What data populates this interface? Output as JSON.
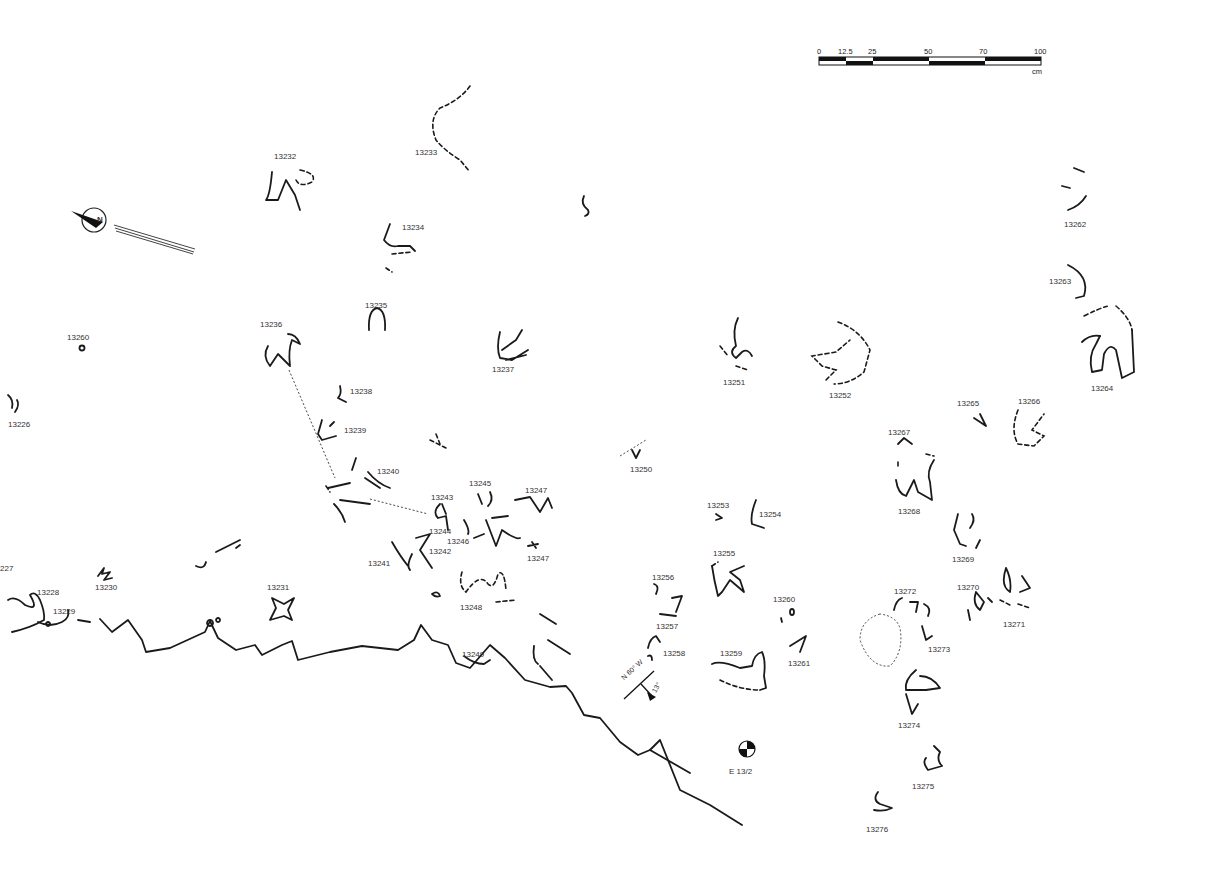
{
  "scale_bar": {
    "ticks": [
      "0",
      "12.5",
      "25",
      "50",
      "70",
      "100"
    ],
    "unit": "cm"
  },
  "north_arrow": {
    "label": "N"
  },
  "strike_dip": {
    "strike": "N 60° W",
    "dip": "13°"
  },
  "station": {
    "label": "E  13/2"
  },
  "tracks": [
    {
      "id": "13226",
      "x": 8,
      "y": 421
    },
    {
      "id": "13227",
      "x": 0,
      "y": 565,
      "partial_label": "227"
    },
    {
      "id": "13228",
      "x": 37,
      "y": 589
    },
    {
      "id": "13229",
      "x": 53,
      "y": 608
    },
    {
      "id": "13230",
      "x": 95,
      "y": 584
    },
    {
      "id": "13231",
      "x": 267,
      "y": 584
    },
    {
      "id": "13232",
      "x": 274,
      "y": 153
    },
    {
      "id": "13233",
      "x": 415,
      "y": 149
    },
    {
      "id": "13234",
      "x": 402,
      "y": 224
    },
    {
      "id": "13235",
      "x": 365,
      "y": 302
    },
    {
      "id": "13236",
      "x": 260,
      "y": 321
    },
    {
      "id": "13237",
      "x": 492,
      "y": 366
    },
    {
      "id": "13238",
      "x": 350,
      "y": 388
    },
    {
      "id": "13239",
      "x": 344,
      "y": 427
    },
    {
      "id": "13240",
      "x": 377,
      "y": 468
    },
    {
      "id": "13241",
      "x": 368,
      "y": 560
    },
    {
      "id": "13242",
      "x": 429,
      "y": 548
    },
    {
      "id": "13243",
      "x": 431,
      "y": 494
    },
    {
      "id": "13244",
      "x": 429,
      "y": 528
    },
    {
      "id": "13245",
      "x": 469,
      "y": 480
    },
    {
      "id": "13246",
      "x": 447,
      "y": 538
    },
    {
      "id": "13247",
      "x": 525,
      "y": 487
    },
    {
      "id": "13247",
      "x": 527,
      "y": 555
    },
    {
      "id": "13248",
      "x": 460,
      "y": 604
    },
    {
      "id": "13249",
      "x": 462,
      "y": 651
    },
    {
      "id": "13250",
      "x": 630,
      "y": 466
    },
    {
      "id": "13251",
      "x": 723,
      "y": 379
    },
    {
      "id": "13252",
      "x": 829,
      "y": 392
    },
    {
      "id": "13253",
      "x": 707,
      "y": 502
    },
    {
      "id": "13254",
      "x": 759,
      "y": 511
    },
    {
      "id": "13255",
      "x": 713,
      "y": 550
    },
    {
      "id": "13256",
      "x": 652,
      "y": 574
    },
    {
      "id": "13257",
      "x": 656,
      "y": 623
    },
    {
      "id": "13258",
      "x": 663,
      "y": 650
    },
    {
      "id": "13259",
      "x": 720,
      "y": 650
    },
    {
      "id": "13260",
      "x": 773,
      "y": 596
    },
    {
      "id": "13260",
      "x": 67,
      "y": 334
    },
    {
      "id": "13261",
      "x": 788,
      "y": 660
    },
    {
      "id": "13262",
      "x": 1064,
      "y": 221
    },
    {
      "id": "13263",
      "x": 1049,
      "y": 278
    },
    {
      "id": "13264",
      "x": 1091,
      "y": 385
    },
    {
      "id": "13265",
      "x": 957,
      "y": 400
    },
    {
      "id": "13266",
      "x": 1018,
      "y": 398
    },
    {
      "id": "13267",
      "x": 888,
      "y": 429
    },
    {
      "id": "13268",
      "x": 898,
      "y": 508
    },
    {
      "id": "13269",
      "x": 952,
      "y": 556
    },
    {
      "id": "13270",
      "x": 957,
      "y": 584
    },
    {
      "id": "13271",
      "x": 1003,
      "y": 621
    },
    {
      "id": "13272",
      "x": 894,
      "y": 588
    },
    {
      "id": "13273",
      "x": 928,
      "y": 646
    },
    {
      "id": "13274",
      "x": 898,
      "y": 722
    },
    {
      "id": "13275",
      "x": 912,
      "y": 783
    },
    {
      "id": "13276",
      "x": 866,
      "y": 826
    }
  ]
}
